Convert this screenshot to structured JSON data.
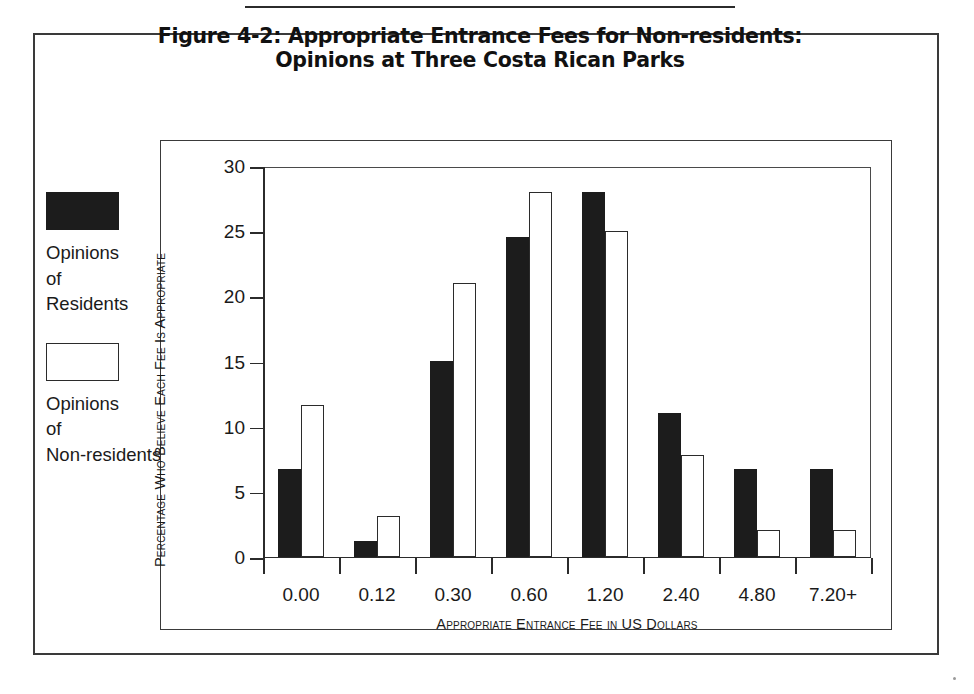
{
  "figure": {
    "title_line1": "Figure 4-2: Appropriate Entrance Fees for Non-residents:",
    "title_line2": "Opinions at Three Costa Rican Parks"
  },
  "legend": {
    "entries": [
      {
        "key": "residents",
        "label": "Opinions of Residents",
        "swatch": "filled-black-rectangle",
        "color": "#1c1c1c"
      },
      {
        "key": "nonresidents",
        "label": "Opinions of Non-residents",
        "swatch": "open-white-rectangle",
        "color": "#ffffff"
      }
    ]
  },
  "chart_data": {
    "type": "bar",
    "title": "Figure 4-2: Appropriate Entrance Fees for Non-residents: Opinions at Three Costa Rican Parks",
    "xlabel": "Appropriate Entrance Fee in US Dollars",
    "ylabel": "Percentage Who Believe Each Fee Is Appropriate",
    "categories": [
      "0.00",
      "0.12",
      "0.30",
      "0.60",
      "1.20",
      "2.40",
      "4.80",
      "7.20+"
    ],
    "series": [
      {
        "name": "Opinions of Residents",
        "color": "#1c1c1c",
        "values": [
          6.7,
          1.2,
          15.0,
          24.5,
          28.0,
          11.0,
          6.7,
          6.7
        ]
      },
      {
        "name": "Opinions of Non-residents",
        "color": "#ffffff",
        "values": [
          11.6,
          3.1,
          21.0,
          28.0,
          25.0,
          7.8,
          2.0,
          2.0
        ]
      }
    ],
    "ylim": [
      0,
      30
    ],
    "yticks": [
      0,
      5,
      10,
      15,
      20,
      25,
      30
    ],
    "ytick_labels": [
      "0",
      "5",
      "10",
      "15",
      "20",
      "25",
      "30"
    ],
    "grid": false,
    "legend_position": "left-outside"
  }
}
